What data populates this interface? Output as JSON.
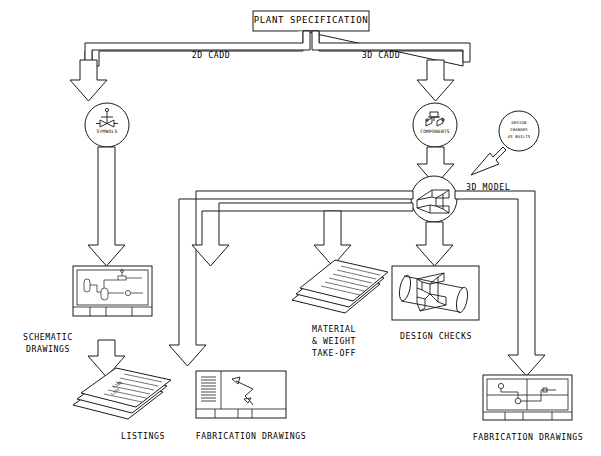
{
  "diagram": {
    "title": "PLANT SPECIFICATION",
    "branches": {
      "left_label": "2D CADD",
      "right_label": "3D CADD"
    },
    "nodes": {
      "symbols": "SYMBOLS",
      "components": "COMPONENTS",
      "model": "3D MODEL",
      "design_changes": {
        "line1": "DESIGN",
        "line2": "CHANGES",
        "line3": "AS BUILTS"
      }
    },
    "outputs": {
      "schematic": {
        "line1": "SCHEMATIC",
        "line2": "DRAWINGS"
      },
      "listings": "LISTINGS",
      "fabrication_left": "FABRICATION DRAWINGS",
      "takeoff": {
        "line1": "MATERIAL",
        "line2": "& WEIGHT",
        "line3": "TAKE-OFF"
      },
      "design_checks": "DESIGN CHECKS",
      "fabrication_right": "FABRICATION DRAWINGS"
    },
    "artwork": {
      "line_list_l1": "LINE",
      "line_list_l2": "LIST"
    },
    "colors": {
      "stroke": "#1a1a1a",
      "background": "#ffffff"
    }
  }
}
